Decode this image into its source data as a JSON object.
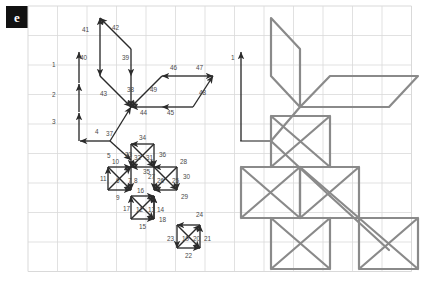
{
  "panel": {
    "letter": "e"
  },
  "colors": {
    "grid_line": "#d9d9d9",
    "grid_border": "#cfcfcf",
    "arrow_stroke": "#2b2b2b",
    "label_text": "#4a4a4a",
    "path_stroke": "#8a8a8a",
    "badge_bg": "#111111",
    "badge_text": "#ffffff",
    "background": "#ffffff"
  },
  "grid": {
    "left": 28,
    "top": 6,
    "cell": 29.5,
    "cols": 13,
    "rows": 9
  },
  "left_panel": {
    "name": "traversal-order-diagram",
    "description": "Grid with numbered directional arrows showing a drawing stroke order",
    "arrows": [
      {
        "id": "1",
        "x1": 79,
        "y1": 83,
        "x2": 79,
        "y2": 52,
        "label_x": 52,
        "label_y": 67
      },
      {
        "id": "2",
        "x1": 79,
        "y1": 112,
        "x2": 79,
        "y2": 84,
        "label_x": 52,
        "label_y": 97
      },
      {
        "id": "3",
        "x1": 79,
        "y1": 141,
        "x2": 79,
        "y2": 113,
        "label_x": 52,
        "label_y": 124
      },
      {
        "id": "4",
        "x1": 110,
        "y1": 141,
        "x2": 80,
        "y2": 141,
        "label_x": 95,
        "label_y": 134
      },
      {
        "id": "5",
        "x1": 110,
        "y1": 141,
        "x2": 131,
        "y2": 160,
        "label_x": 107,
        "label_y": 158
      },
      {
        "id": "6",
        "x1": 108,
        "y1": 190,
        "x2": 131,
        "y2": 167,
        "label_x": 116,
        "label_y": 183
      },
      {
        "id": "7",
        "x1": 108,
        "y1": 167,
        "x2": 131,
        "y2": 190,
        "label_x": 128,
        "label_y": 183
      },
      {
        "id": "8",
        "x1": 131,
        "y1": 167,
        "x2": 131,
        "y2": 190,
        "label_x": 134,
        "label_y": 183
      },
      {
        "id": "9",
        "x1": 108,
        "y1": 190,
        "x2": 131,
        "y2": 190,
        "label_x": 116,
        "label_y": 200
      },
      {
        "id": "10",
        "x1": 108,
        "y1": 167,
        "x2": 131,
        "y2": 167,
        "label_x": 112,
        "label_y": 164
      },
      {
        "id": "11",
        "x1": 108,
        "y1": 190,
        "x2": 108,
        "y2": 167,
        "label_x": 100,
        "label_y": 181
      },
      {
        "id": "12",
        "x1": 131,
        "y1": 219,
        "x2": 154,
        "y2": 196,
        "label_x": 136,
        "label_y": 212
      },
      {
        "id": "13",
        "x1": 131,
        "y1": 196,
        "x2": 154,
        "y2": 219,
        "label_x": 148,
        "label_y": 212
      },
      {
        "id": "14",
        "x1": 154,
        "y1": 219,
        "x2": 154,
        "y2": 196,
        "label_x": 157,
        "label_y": 212
      },
      {
        "id": "15",
        "x1": 131,
        "y1": 219,
        "x2": 154,
        "y2": 219,
        "label_x": 139,
        "label_y": 229
      },
      {
        "id": "16",
        "x1": 131,
        "y1": 196,
        "x2": 154,
        "y2": 196,
        "label_x": 137,
        "label_y": 193
      },
      {
        "id": "17",
        "x1": 131,
        "y1": 219,
        "x2": 131,
        "y2": 196,
        "label_x": 123,
        "label_y": 211
      },
      {
        "id": "18",
        "x1": 154,
        "y1": 219,
        "x2": 154,
        "y2": 196,
        "label_x": 159,
        "label_y": 222
      },
      {
        "id": "19",
        "x1": 177,
        "y1": 248,
        "x2": 200,
        "y2": 225,
        "label_x": 182,
        "label_y": 241
      },
      {
        "id": "20",
        "x1": 177,
        "y1": 225,
        "x2": 200,
        "y2": 248,
        "label_x": 193,
        "label_y": 241
      },
      {
        "id": "21",
        "x1": 200,
        "y1": 248,
        "x2": 200,
        "y2": 225,
        "label_x": 204,
        "label_y": 241
      },
      {
        "id": "22",
        "x1": 177,
        "y1": 248,
        "x2": 200,
        "y2": 248,
        "label_x": 185,
        "label_y": 258
      },
      {
        "id": "23",
        "x1": 177,
        "y1": 225,
        "x2": 177,
        "y2": 248,
        "label_x": 167,
        "label_y": 241
      },
      {
        "id": "24",
        "x1": 200,
        "y1": 225,
        "x2": 177,
        "y2": 225,
        "label_x": 196,
        "label_y": 217
      },
      {
        "id": "25",
        "x1": 154,
        "y1": 167,
        "x2": 177,
        "y2": 190,
        "label_x": 172,
        "label_y": 183
      },
      {
        "id": "26",
        "x1": 177,
        "y1": 167,
        "x2": 154,
        "y2": 190,
        "label_x": 157,
        "label_y": 183
      },
      {
        "id": "27",
        "x1": 154,
        "y1": 167,
        "x2": 154,
        "y2": 190,
        "label_x": 148,
        "label_y": 179
      },
      {
        "id": "28",
        "x1": 177,
        "y1": 167,
        "x2": 154,
        "y2": 167,
        "label_x": 180,
        "label_y": 164
      },
      {
        "id": "29",
        "x1": 177,
        "y1": 190,
        "x2": 154,
        "y2": 190,
        "label_x": 181,
        "label_y": 199
      },
      {
        "id": "30",
        "x1": 177,
        "y1": 167,
        "x2": 177,
        "y2": 190,
        "label_x": 183,
        "label_y": 179
      },
      {
        "id": "31",
        "x1": 131,
        "y1": 144,
        "x2": 154,
        "y2": 167,
        "label_x": 146,
        "label_y": 160
      },
      {
        "id": "32",
        "x1": 154,
        "y1": 144,
        "x2": 131,
        "y2": 167,
        "label_x": 134,
        "label_y": 160
      },
      {
        "id": "33",
        "x1": 131,
        "y1": 144,
        "x2": 131,
        "y2": 167,
        "label_x": 125,
        "label_y": 157
      },
      {
        "id": "34",
        "x1": 154,
        "y1": 144,
        "x2": 131,
        "y2": 144,
        "label_x": 139,
        "label_y": 140
      },
      {
        "id": "35",
        "x1": 154,
        "y1": 167,
        "x2": 131,
        "y2": 167,
        "label_x": 143,
        "label_y": 174
      },
      {
        "id": "36",
        "x1": 154,
        "y1": 144,
        "x2": 154,
        "y2": 167,
        "label_x": 159,
        "label_y": 157
      },
      {
        "id": "37",
        "x1": 110,
        "y1": 141,
        "x2": 131,
        "y2": 107,
        "label_x": 106,
        "label_y": 136
      },
      {
        "id": "38",
        "x1": 131,
        "y1": 76,
        "x2": 131,
        "y2": 107,
        "label_x": 127,
        "label_y": 92
      },
      {
        "id": "39",
        "x1": 131,
        "y1": 49,
        "x2": 131,
        "y2": 76,
        "label_x": 122,
        "label_y": 60
      },
      {
        "id": "40",
        "x1": 100,
        "y1": 49,
        "x2": 100,
        "y2": 76,
        "label_x": 80,
        "label_y": 60
      },
      {
        "id": "41",
        "x1": 100,
        "y1": 49,
        "x2": 100,
        "y2": 18,
        "label_x": 82,
        "label_y": 32
      },
      {
        "id": "42",
        "x1": 131,
        "y1": 49,
        "x2": 100,
        "y2": 18,
        "label_x": 112,
        "label_y": 30
      },
      {
        "id": "43",
        "x1": 100,
        "y1": 76,
        "x2": 131,
        "y2": 107,
        "label_x": 100,
        "label_y": 96
      },
      {
        "id": "44",
        "x1": 162,
        "y1": 107,
        "x2": 131,
        "y2": 107,
        "label_x": 140,
        "label_y": 115
      },
      {
        "id": "45",
        "x1": 193,
        "y1": 107,
        "x2": 162,
        "y2": 107,
        "label_x": 167,
        "label_y": 115
      },
      {
        "id": "46",
        "x1": 193,
        "y1": 76,
        "x2": 162,
        "y2": 76,
        "label_x": 170,
        "label_y": 70
      },
      {
        "id": "47",
        "x1": 193,
        "y1": 76,
        "x2": 213,
        "y2": 76,
        "label_x": 196,
        "label_y": 70
      },
      {
        "id": "48",
        "x1": 193,
        "y1": 107,
        "x2": 213,
        "y2": 76,
        "label_x": 199,
        "label_y": 95
      },
      {
        "id": "49",
        "x1": 162,
        "y1": 76,
        "x2": 131,
        "y2": 107,
        "label_x": 150,
        "label_y": 92
      }
    ]
  },
  "right_panel": {
    "name": "rendered-stroke-figure",
    "description": "Resulting line figure drawn by following the numbered arrow order",
    "start_arrow": {
      "label": "1",
      "x1": 241,
      "y1": 141,
      "x2": 241,
      "y2": 52,
      "label_x": 231,
      "label_y": 60
    },
    "paths": [
      {
        "name": "outline-main",
        "d": "M241 141 L271 141 L300 107 L271 76 L271 18 L300 49 L300 107"
      },
      {
        "name": "upper-right-wing",
        "d": "M300 107 L389 107 L418 76 L330 76 L300 107"
      },
      {
        "name": "lower-left-diagonal",
        "d": "M271 141 L330 196"
      },
      {
        "name": "cross-box-top",
        "d": "M271 116 L330 116 L330 167 L271 167 Z M271 116 L330 167 M330 116 L271 167"
      },
      {
        "name": "cross-box-left",
        "d": "M241 167 L300 167 L300 218 L241 218 Z M241 167 L300 218 M300 167 L241 218"
      },
      {
        "name": "cross-box-center",
        "d": "M300 167 L359 167 L359 218 L300 218 Z M300 167 L359 218 M359 167 L300 218"
      },
      {
        "name": "cross-box-bottom",
        "d": "M271 218 L330 218 L330 269 L271 269 Z M271 218 L330 269 M330 218 L271 269"
      },
      {
        "name": "cross-box-corner",
        "d": "M359 218 L418 218 L418 269 L359 269 Z M359 218 L418 269 M418 218 L359 269"
      },
      {
        "name": "link-diagonal",
        "d": "M330 196 L389 250"
      }
    ]
  }
}
